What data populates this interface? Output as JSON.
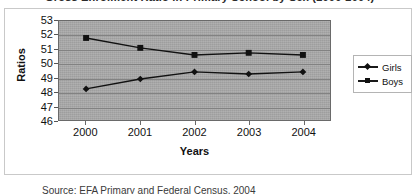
{
  "figure": {
    "title": "Gross Enrolment Ratio in Primary School by Sex (2000-2004)",
    "caption": "Source: EFA Primary and Federal Census, 2004"
  },
  "chart_data": {
    "type": "line",
    "title": "Gross Enrolment Ratio in Primary School by Sex (2000-2004)",
    "xlabel": "Years",
    "ylabel": "Ratios",
    "categories": [
      "2000",
      "2001",
      "2002",
      "2003",
      "2004"
    ],
    "ylim": [
      46,
      53
    ],
    "ytick_step": 1,
    "yticks": [
      53,
      52,
      51,
      50,
      49,
      48,
      47,
      46
    ],
    "grid": true,
    "grid_axis": "y",
    "legend_position": "right",
    "plot_background": "#a9a9a9",
    "series": [
      {
        "name": "Girls",
        "marker": "diamond",
        "color": "#111111",
        "values": [
          48.2,
          48.9,
          49.4,
          49.25,
          49.4
        ]
      },
      {
        "name": "Boys",
        "marker": "square",
        "color": "#111111",
        "values": [
          51.8,
          51.1,
          50.6,
          50.75,
          50.6
        ]
      }
    ]
  }
}
